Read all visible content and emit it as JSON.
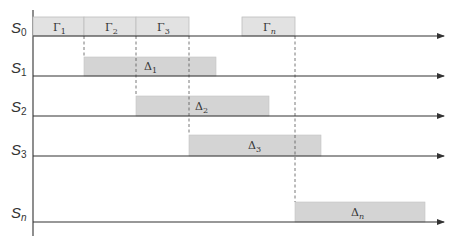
{
  "diagram": {
    "rows": [
      {
        "label": "S",
        "sub": "0"
      },
      {
        "label": "S",
        "sub": "1"
      },
      {
        "label": "S",
        "sub": "2"
      },
      {
        "label": "S",
        "sub": "3"
      },
      {
        "label": "S",
        "sub": "n"
      }
    ],
    "gamma_boxes": [
      {
        "symbol": "Γ",
        "sub": "1"
      },
      {
        "symbol": "Γ",
        "sub": "2"
      },
      {
        "symbol": "Γ",
        "sub": "3"
      },
      {
        "symbol": "Γ",
        "sub": "n"
      }
    ],
    "delta_boxes": [
      {
        "symbol": "Δ",
        "sub": "1"
      },
      {
        "symbol": "Δ",
        "sub": "2"
      },
      {
        "symbol": "Δ",
        "sub": "3"
      },
      {
        "symbol": "Δ",
        "sub": "n"
      }
    ],
    "colors": {
      "gamma_fill": "#e2e2e2",
      "delta_fill": "#d4d4d4",
      "line": "#333333"
    }
  }
}
